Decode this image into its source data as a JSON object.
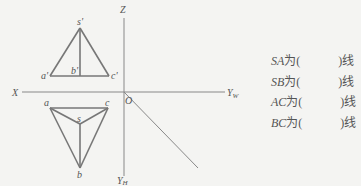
{
  "diagram": {
    "axes": {
      "x": "X",
      "z": "Z",
      "yw": "Y",
      "yw_sub": "W",
      "yh": "Y",
      "yh_sub": "H",
      "origin": "O"
    },
    "front_view": {
      "labels": {
        "s": "s'",
        "a": "a'",
        "b": "b'",
        "c": "c'"
      }
    },
    "top_view": {
      "labels": {
        "s": "s",
        "a": "a",
        "b": "b",
        "c": "c"
      }
    },
    "line_color": "#777777"
  },
  "questions": [
    {
      "code": "SA",
      "prefix": "为(",
      "suffix": ")线"
    },
    {
      "code": "SB",
      "prefix": "为(",
      "suffix": ")线"
    },
    {
      "code": "AC",
      "prefix": "为(",
      "suffix": ")线"
    },
    {
      "code": "BC",
      "prefix": "为(",
      "suffix": ")线"
    }
  ]
}
